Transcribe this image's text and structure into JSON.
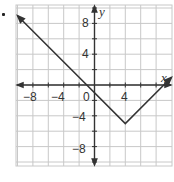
{
  "chart_data": {
    "type": "line",
    "title": "",
    "function": "y = |x - 4| - 5",
    "xlabel": "x",
    "ylabel": "y",
    "xlim": [
      -10,
      10
    ],
    "ylim": [
      -10.5,
      10.5
    ],
    "grid": true,
    "grid_step": 2,
    "x_ticks": [
      -8,
      -4,
      0,
      4
    ],
    "y_ticks": [
      8,
      4,
      -4,
      -8
    ],
    "x_tick_labels": [
      "−8",
      "−4",
      "0",
      "4"
    ],
    "y_tick_labels": [
      "8",
      "4",
      "−4",
      "−8"
    ],
    "series": [
      {
        "name": "graph",
        "points": [
          [
            -10,
            9
          ],
          [
            -1,
            0
          ],
          [
            4,
            -5
          ],
          [
            9,
            0
          ],
          [
            10,
            1
          ]
        ],
        "arrows": [
          "start",
          "end"
        ]
      }
    ],
    "vertex": [
      4,
      -5
    ],
    "x_intercepts": [
      -1,
      9
    ],
    "y_intercept": -1
  },
  "labels": {
    "x_axis": "x",
    "y_axis": "y",
    "origin": "0",
    "xm8": "−8",
    "xm4": "−4",
    "x4": "4",
    "y8": "8",
    "y4": "4",
    "ym4": "−4",
    "ym8": "−8"
  },
  "colors": {
    "grid": "#c8c8c8",
    "axis": "#333333",
    "line": "#333333"
  }
}
